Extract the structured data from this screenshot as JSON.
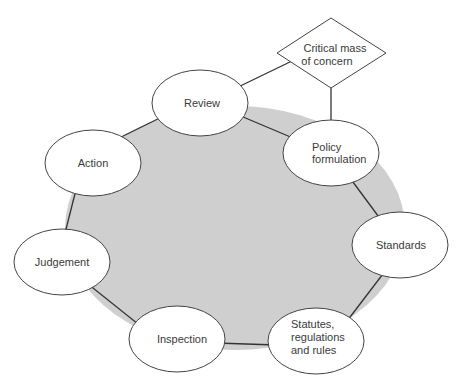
{
  "diagram": {
    "colors": {
      "background_disc": "#cfcfcf",
      "stroke": "#333333",
      "node_fill": "#ffffff",
      "text": "#3a3a3a"
    },
    "trigger": {
      "id": "critical-mass",
      "shape": "diamond",
      "lines": [
        "Critical mass",
        "of concern"
      ]
    },
    "nodes": [
      {
        "id": "review",
        "lines": [
          "Review"
        ]
      },
      {
        "id": "policy-formulation",
        "lines": [
          "Policy",
          "formulation"
        ]
      },
      {
        "id": "standards",
        "lines": [
          "Standards"
        ]
      },
      {
        "id": "statutes",
        "lines": [
          "Statutes,",
          "regulations",
          "and rules"
        ]
      },
      {
        "id": "inspection",
        "lines": [
          "Inspection"
        ]
      },
      {
        "id": "judgement",
        "lines": [
          "Judgement"
        ]
      },
      {
        "id": "action",
        "lines": [
          "Action"
        ]
      }
    ],
    "edges": [
      {
        "from": "critical-mass",
        "to": "review"
      },
      {
        "from": "critical-mass",
        "to": "policy-formulation"
      },
      {
        "from": "review",
        "to": "policy-formulation"
      },
      {
        "from": "policy-formulation",
        "to": "standards"
      },
      {
        "from": "standards",
        "to": "statutes"
      },
      {
        "from": "statutes",
        "to": "inspection"
      },
      {
        "from": "inspection",
        "to": "judgement"
      },
      {
        "from": "judgement",
        "to": "action"
      },
      {
        "from": "action",
        "to": "review"
      }
    ]
  }
}
